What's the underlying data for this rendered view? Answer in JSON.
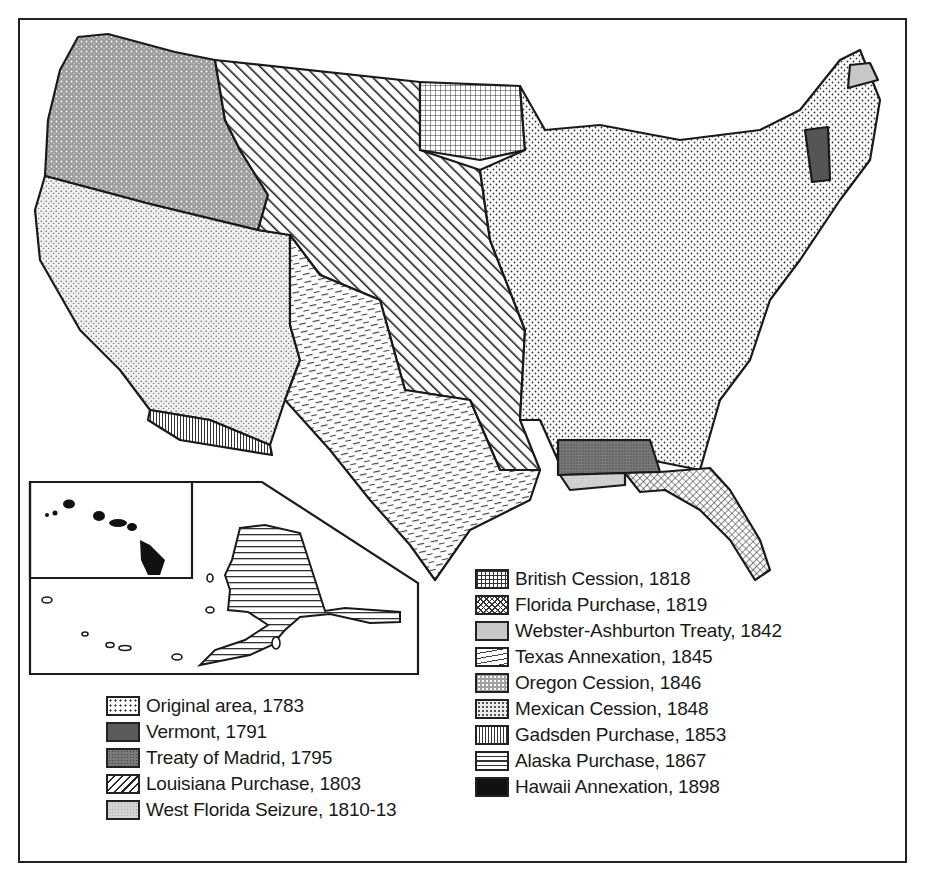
{
  "map": {
    "title": "Territorial Acquisitions of the United States",
    "insets": [
      {
        "name": "Hawaii",
        "pattern": "hawaii"
      },
      {
        "name": "Alaska",
        "pattern": "alaska"
      }
    ]
  },
  "legend_left": {
    "items": [
      {
        "label": "Original area, 1783",
        "pattern": "original",
        "color": "#ffffff"
      },
      {
        "label": "Vermont, 1791",
        "pattern": "vermont",
        "color": "#5a5a5a"
      },
      {
        "label": "Treaty of Madrid, 1795",
        "pattern": "madrid",
        "color": "#7a7a7a"
      },
      {
        "label": "Louisiana Purchase, 1803",
        "pattern": "louisiana",
        "color": "#ffffff"
      },
      {
        "label": "West Florida Seizure, 1810-13",
        "pattern": "westfl",
        "color": "#d4d4d4"
      }
    ]
  },
  "legend_right": {
    "items": [
      {
        "label": "British Cession, 1818",
        "pattern": "british",
        "color": "#ffffff"
      },
      {
        "label": "Florida Purchase, 1819",
        "pattern": "florida",
        "color": "#ffffff"
      },
      {
        "label": "Webster-Ashburton Treaty, 1842",
        "pattern": "webster",
        "color": "#c8c8c8"
      },
      {
        "label": "Texas Annexation, 1845",
        "pattern": "texas",
        "color": "#ffffff"
      },
      {
        "label": "Oregon Cession, 1846",
        "pattern": "oregon",
        "color": "#a0a0a0"
      },
      {
        "label": "Mexican Cession, 1848",
        "pattern": "mexican",
        "color": "#ededed"
      },
      {
        "label": "Gadsden Purchase, 1853",
        "pattern": "gadsden",
        "color": "#ffffff"
      },
      {
        "label": "Alaska Purchase, 1867",
        "pattern": "alaska",
        "color": "#ffffff"
      },
      {
        "label": "Hawaii Annexation, 1898",
        "pattern": "hawaii",
        "color": "#111111"
      }
    ]
  }
}
